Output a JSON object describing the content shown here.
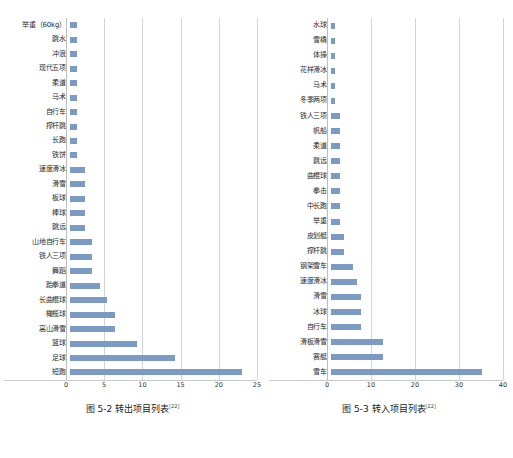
{
  "figures": [
    {
      "caption_text": "图 5-2  转出项目列表",
      "caption_sup": "[22]",
      "chart_data": {
        "type": "bar",
        "orientation": "horizontal",
        "title": "转出项目列表",
        "xlabel": "",
        "ylabel": "",
        "xlim": [
          0,
          25
        ],
        "xticks": [
          0,
          5,
          10,
          15,
          20,
          25
        ],
        "grid": true,
        "legend": false,
        "categories": [
          "举重（60kg）",
          "跳水",
          "冲浪",
          "现代五项",
          "柔道",
          "马术",
          "自行车",
          "撑杆跳",
          "长跑",
          "铁饼",
          "速度滑冰",
          "滑雪",
          "板球",
          "棒球",
          "跳远",
          "山地自行车",
          "铁人三项",
          "舞蹈",
          "跆拳道",
          "长曲棍球",
          "橄榄球",
          "高山滑雪",
          "篮球",
          "足球",
          "短跑"
        ],
        "values": [
          1,
          1,
          1,
          1,
          1,
          1,
          1,
          1,
          1,
          1,
          2,
          2,
          2,
          2,
          2,
          3,
          3,
          3,
          4,
          5,
          6,
          6,
          9,
          14,
          23
        ]
      }
    },
    {
      "caption_text": "图 5-3  转入项目列表",
      "caption_sup": "[22]",
      "chart_data": {
        "type": "bar",
        "orientation": "horizontal",
        "title": "转入项目列表",
        "xlabel": "",
        "ylabel": "",
        "xlim": [
          0,
          40
        ],
        "xticks": [
          0,
          10,
          20,
          30,
          40
        ],
        "grid": true,
        "legend": false,
        "categories": [
          "水球",
          "雪橇",
          "体操",
          "花样滑冰",
          "马术",
          "冬季两项",
          "铁人三项",
          "帆船",
          "柔道",
          "跳远",
          "曲棍球",
          "拳击",
          "中长跑",
          "举重",
          "皮划艇",
          "撑杆跳",
          "钢架雪车",
          "速度滑冰",
          "滑雪",
          "冰球",
          "自行车",
          "滑板滑雪",
          "赛艇",
          "雪车"
        ],
        "values": [
          1,
          1,
          1,
          1,
          1,
          1,
          2,
          2,
          2,
          2,
          2,
          2,
          2,
          2,
          3,
          3,
          5,
          6,
          7,
          7,
          7,
          12,
          12,
          35
        ]
      }
    }
  ],
  "style": {
    "bar_color": "#7b9ac4",
    "grid_color": "#d4d4d4",
    "text_color": "#1a1a1a"
  }
}
